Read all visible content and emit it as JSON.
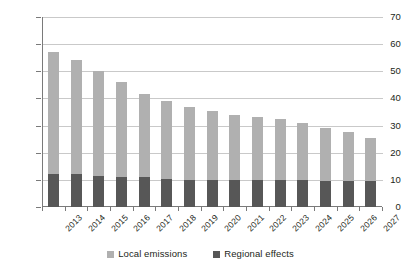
{
  "chart_data": {
    "type": "bar",
    "stacked": true,
    "title": "",
    "subtitle": "",
    "xlabel": "",
    "ylabel": "",
    "ylim": [
      0,
      70
    ],
    "yticks": [
      0,
      10,
      20,
      30,
      40,
      50,
      60,
      70
    ],
    "grid": true,
    "legend_position": "bottom-center",
    "categories": [
      "2013",
      "2014",
      "2015",
      "2016",
      "2017",
      "2018",
      "2019",
      "2020",
      "2021",
      "2022",
      "2023",
      "2024",
      "2025",
      "2026",
      "2027"
    ],
    "series": [
      {
        "name": "Regional effects",
        "color": "#575757",
        "values": [
          12,
          12,
          11.5,
          11,
          11,
          10.5,
          10,
          10,
          10,
          10,
          10,
          10,
          9.5,
          9.5,
          9.5
        ]
      },
      {
        "name": "Local emissions",
        "color": "#b0b0b0",
        "values": [
          45,
          42,
          38.5,
          35,
          30.5,
          28.5,
          27,
          25.5,
          24,
          23,
          22.5,
          21,
          19.5,
          18,
          16
        ]
      }
    ],
    "totals": [
      57,
      54,
      50,
      46,
      41.5,
      39,
      37,
      35.5,
      34,
      33,
      32.5,
      31,
      29,
      27.5,
      25.5
    ]
  },
  "axes": {
    "y_tick_labels": [
      "70",
      "60",
      "50",
      "40",
      "30",
      "20",
      "10",
      "0"
    ],
    "x_tick_labels": [
      "2013",
      "2014",
      "2015",
      "2016",
      "2017",
      "2018",
      "2019",
      "2020",
      "2021",
      "2022",
      "2023",
      "2024",
      "2025",
      "2026",
      "2027"
    ]
  },
  "legend": {
    "items": [
      {
        "label": "Local emissions",
        "color": "#b0b0b0"
      },
      {
        "label": "Regional effects",
        "color": "#575757"
      }
    ]
  }
}
